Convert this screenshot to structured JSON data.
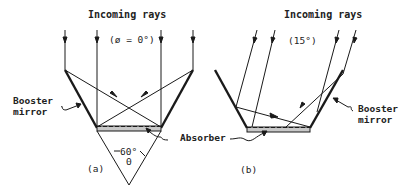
{
  "panel_a": {
    "title": "Incoming rays",
    "angle_label": "(ø = 0°)",
    "booster_label_line1": "Booster",
    "booster_label_line2": "mirror",
    "absorber_label": "Absorber",
    "cone_angle": "60°",
    "theta": "Θ",
    "caption": "(a)"
  },
  "panel_b": {
    "title": "Incoming rays",
    "angle_label": "(15°)",
    "booster_label_line1": "Booster",
    "booster_label_line2": "mirror",
    "caption": "(b)"
  },
  "colors": {
    "line": "#1a1a1a",
    "absorber_fill": "#c8c8c8",
    "background": "#ffffff"
  }
}
